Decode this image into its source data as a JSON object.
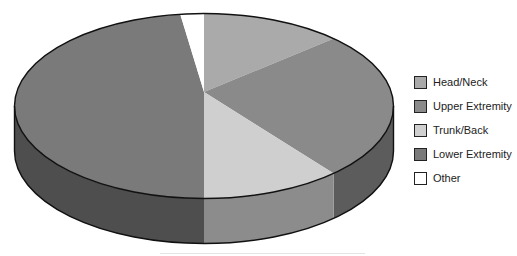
{
  "chart_data": {
    "type": "pie",
    "style": "3d",
    "title": "",
    "start_angle_deg": 0,
    "direction": "clockwise",
    "legend_position": "right",
    "categories": [
      "Head/Neck",
      "Upper Extremity",
      "Trunk/Back",
      "Lower Extremity",
      "Other"
    ],
    "values": [
      12,
      26,
      12,
      48,
      2
    ],
    "units": "percent (estimated)",
    "colors": [
      "#aaaaaa",
      "#8a8a8a",
      "#cfcfcf",
      "#7a7a7a",
      "#ffffff"
    ],
    "side_colors": [
      "#6e6e6e",
      "#5c5c5c",
      "#8c8c8c",
      "#4e4e4e",
      "#dddddd"
    ]
  },
  "legend": {
    "items": [
      {
        "label": "Head/Neck",
        "color": "#aaaaaa"
      },
      {
        "label": "Upper Extremity",
        "color": "#8a8a8a"
      },
      {
        "label": "Trunk/Back",
        "color": "#cfcfcf"
      },
      {
        "label": "Lower Extremity",
        "color": "#7a7a7a"
      },
      {
        "label": "Other",
        "color": "#ffffff"
      }
    ]
  }
}
